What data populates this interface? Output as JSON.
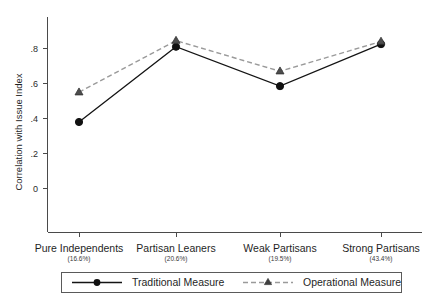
{
  "chart_data": {
    "type": "line",
    "title": "",
    "xlabel": "",
    "ylabel": "Correlation with Issue Index",
    "categories": [
      "Pure Independents",
      "Partisan Leaners",
      "Weak Partisans",
      "Strong Partisans"
    ],
    "category_shares": [
      "(16.6%)",
      "(20.6%)",
      "(19.5%)",
      "(43.4%)"
    ],
    "series": [
      {
        "name": "Traditional Measure",
        "values": [
          0.38,
          0.81,
          0.585,
          0.825
        ],
        "marker": "circle",
        "linestyle": "solid",
        "color": "#141414"
      },
      {
        "name": "Operational Measure",
        "values": [
          0.55,
          0.845,
          0.67,
          0.84
        ],
        "marker": "triangle",
        "linestyle": "dashed",
        "color": "#9a9a9a"
      }
    ],
    "ylim": [
      -0.28,
      0.94
    ],
    "yticks": [
      0,
      0.2,
      0.4,
      0.6,
      0.8
    ],
    "ytick_labels": [
      "0",
      ".2",
      ".4",
      ".6",
      ".8"
    ],
    "grid": false,
    "legend_position": "bottom"
  },
  "axis": {
    "y_title": "Correlation with Issue Index",
    "y_tick_0": "0",
    "y_tick_1": ".2",
    "y_tick_2": ".4",
    "y_tick_3": ".6",
    "y_tick_4": ".8"
  },
  "categories": [
    {
      "label": "Pure Independents",
      "share": "(16.6%)"
    },
    {
      "label": "Partisan Leaners",
      "share": "(20.6%)"
    },
    {
      "label": "Weak Partisans",
      "share": "(19.5%)"
    },
    {
      "label": "Strong Partisans",
      "share": "(43.4%)"
    }
  ],
  "legend": {
    "items": [
      {
        "label": "Traditional Measure",
        "marker": "circle-marker-icon",
        "style": "solid"
      },
      {
        "label": "Operational Measure",
        "marker": "triangle-marker-icon",
        "style": "dashed"
      }
    ]
  },
  "colors": {
    "traditional": "#141414",
    "operational": "#9a9a9a",
    "axis": "#4a4a4a",
    "background": "#ffffff"
  }
}
